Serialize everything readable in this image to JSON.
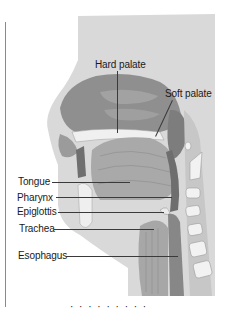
{
  "figure": {
    "type": "anatomical-diagram",
    "labels": {
      "hard_palate": "Hard palate",
      "soft_palate": "Soft palate",
      "tongue": "Tongue",
      "pharynx": "Pharynx",
      "epiglottis": "Epiglottis",
      "trachea": "Trachea",
      "esophagus": "Esophagus"
    },
    "caption_clipped": "· · ·  · ·  · · ·  ·"
  },
  "colors": {
    "background_panel": "#d6d6d6",
    "tissue_dark": "#8e8e8e",
    "tissue_mid": "#b4b4b4",
    "bone_light": "#ececec",
    "label_text": "#1a1a1a"
  }
}
